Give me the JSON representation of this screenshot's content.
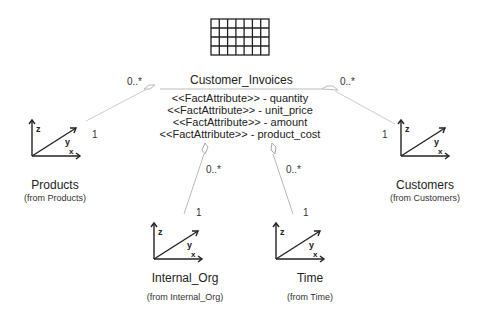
{
  "fact": {
    "name": "Customer_Invoices",
    "icon": "fact-table-grid-icon",
    "attributes": [
      "<<FactAttribute>> - quantity",
      "<<FactAttribute>> - unit_price",
      "<<FactAttribute>> - amount",
      "<<FactAttribute>> - product_cost"
    ]
  },
  "dimensions": [
    {
      "name": "Products",
      "from": "(from Products)",
      "fact_mult": "0..*",
      "dim_mult": "1",
      "icon": "dimension-axes-icon"
    },
    {
      "name": "Customers",
      "from": "(from Customers)",
      "fact_mult": "0..*",
      "dim_mult": "1",
      "icon": "dimension-axes-icon"
    },
    {
      "name": "Internal_Org",
      "from": "(from Internal_Org)",
      "fact_mult": "0..*",
      "dim_mult": "1",
      "icon": "dimension-axes-icon"
    },
    {
      "name": "Time",
      "from": "(from Time)",
      "fact_mult": "0..*",
      "dim_mult": "1",
      "icon": "dimension-axes-icon"
    }
  ],
  "axis_labels": {
    "x": "x",
    "y": "y",
    "z": "z"
  }
}
